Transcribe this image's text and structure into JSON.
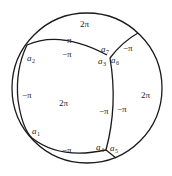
{
  "diagram": {
    "type": "circle-partition",
    "regions": [
      {
        "id": "top",
        "label": "2π"
      },
      {
        "id": "center",
        "label": "2π"
      },
      {
        "id": "right",
        "label": "2π"
      }
    ],
    "edge_labels": {
      "top_upper": "−π",
      "top_lower": "−π",
      "upper_right": "−π",
      "left": "−π",
      "bottom": "−π",
      "mid_left": "−π",
      "mid_right": "−π"
    },
    "vertices": {
      "a1": {
        "base": "a",
        "sub": "1"
      },
      "a2": {
        "base": "a",
        "sub": "2"
      },
      "a3": {
        "base": "a",
        "sub": "3"
      },
      "a4": {
        "base": "a",
        "sub": "4"
      },
      "a5": {
        "base": "a",
        "sub": "5"
      },
      "a6": {
        "base": "a",
        "sub": "6"
      },
      "a7": {
        "base": "a",
        "sub": "7"
      }
    }
  }
}
